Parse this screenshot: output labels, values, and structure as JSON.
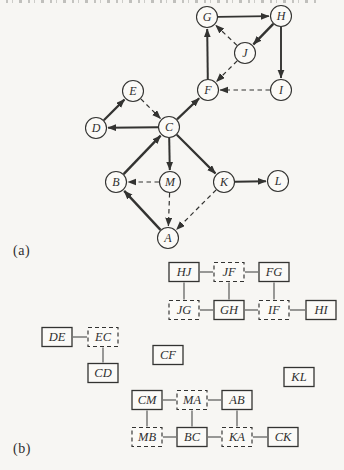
{
  "page": {
    "background": "#f7f6f3",
    "ink": "#333331",
    "node_fill": "#fbfaf7",
    "link_color": "#4a4a48"
  },
  "panel_a": {
    "label": "(a)",
    "node_radius": 10.5,
    "nodes": [
      {
        "id": "G",
        "x": 207,
        "y": 17
      },
      {
        "id": "H",
        "x": 281,
        "y": 16
      },
      {
        "id": "J",
        "x": 245,
        "y": 53
      },
      {
        "id": "F",
        "x": 208,
        "y": 90
      },
      {
        "id": "I",
        "x": 281,
        "y": 90
      },
      {
        "id": "E",
        "x": 133,
        "y": 91
      },
      {
        "id": "D",
        "x": 96,
        "y": 128
      },
      {
        "id": "C",
        "x": 169,
        "y": 127
      },
      {
        "id": "B",
        "x": 116,
        "y": 182
      },
      {
        "id": "M",
        "x": 170,
        "y": 182
      },
      {
        "id": "K",
        "x": 224,
        "y": 182
      },
      {
        "id": "L",
        "x": 278,
        "y": 181
      },
      {
        "id": "A",
        "x": 168,
        "y": 238
      }
    ],
    "edges": [
      {
        "from": "G",
        "to": "H",
        "style": "solid",
        "w": 1.7
      },
      {
        "from": "H",
        "to": "J",
        "style": "solid",
        "w": 2.4
      },
      {
        "from": "F",
        "to": "G",
        "style": "solid",
        "w": 2.0
      },
      {
        "from": "H",
        "to": "I",
        "style": "solid",
        "w": 1.9
      },
      {
        "from": "J",
        "to": "G",
        "style": "dashed",
        "w": 1.2
      },
      {
        "from": "J",
        "to": "F",
        "style": "dashed",
        "w": 1.2
      },
      {
        "from": "I",
        "to": "F",
        "style": "dashed",
        "w": 1.2
      },
      {
        "from": "C",
        "to": "F",
        "style": "solid",
        "w": 2.2
      },
      {
        "from": "D",
        "to": "E",
        "style": "solid",
        "w": 2.2
      },
      {
        "from": "E",
        "to": "C",
        "style": "dashed",
        "w": 1.2
      },
      {
        "from": "C",
        "to": "D",
        "style": "solid",
        "w": 2.0
      },
      {
        "from": "B",
        "to": "C",
        "style": "solid",
        "w": 2.4
      },
      {
        "from": "C",
        "to": "M",
        "style": "solid",
        "w": 2.0
      },
      {
        "from": "C",
        "to": "K",
        "style": "solid",
        "w": 2.2
      },
      {
        "from": "M",
        "to": "B",
        "style": "dashed",
        "w": 1.2
      },
      {
        "from": "M",
        "to": "A",
        "style": "dashed",
        "w": 1.2
      },
      {
        "from": "K",
        "to": "A",
        "style": "dashed",
        "w": 1.2
      },
      {
        "from": "K",
        "to": "L",
        "style": "solid",
        "w": 2.0
      },
      {
        "from": "A",
        "to": "B",
        "style": "solid",
        "w": 2.4
      }
    ]
  },
  "panel_b": {
    "label": "(b)",
    "box_w": 30,
    "box_h": 19,
    "boxes": [
      {
        "id": "HJ",
        "x": 184,
        "y": 272,
        "style": "solid"
      },
      {
        "id": "JF",
        "x": 229,
        "y": 272,
        "style": "dashed"
      },
      {
        "id": "FG",
        "x": 274,
        "y": 272,
        "style": "solid"
      },
      {
        "id": "JG",
        "x": 184,
        "y": 310,
        "style": "dashed"
      },
      {
        "id": "GH",
        "x": 229,
        "y": 310,
        "style": "solid"
      },
      {
        "id": "IF",
        "x": 274,
        "y": 310,
        "style": "dashed"
      },
      {
        "id": "HI",
        "x": 321,
        "y": 310,
        "style": "solid"
      },
      {
        "id": "DE",
        "x": 57,
        "y": 337,
        "style": "solid"
      },
      {
        "id": "EC",
        "x": 103,
        "y": 337,
        "style": "dashed"
      },
      {
        "id": "CD",
        "x": 103,
        "y": 373,
        "style": "solid"
      },
      {
        "id": "CF",
        "x": 168,
        "y": 355,
        "style": "solid"
      },
      {
        "id": "KL",
        "x": 299,
        "y": 377,
        "style": "solid"
      },
      {
        "id": "CM",
        "x": 147,
        "y": 400,
        "style": "solid"
      },
      {
        "id": "MA",
        "x": 192,
        "y": 400,
        "style": "dashed"
      },
      {
        "id": "AB",
        "x": 237,
        "y": 400,
        "style": "solid"
      },
      {
        "id": "MB",
        "x": 147,
        "y": 437,
        "style": "dashed"
      },
      {
        "id": "BC",
        "x": 192,
        "y": 437,
        "style": "solid"
      },
      {
        "id": "KA",
        "x": 237,
        "y": 437,
        "style": "dashed"
      },
      {
        "id": "CK",
        "x": 283,
        "y": 437,
        "style": "solid"
      }
    ],
    "links": [
      {
        "a": "HJ",
        "b": "JF"
      },
      {
        "a": "JF",
        "b": "FG"
      },
      {
        "a": "HJ",
        "b": "JG"
      },
      {
        "a": "JF",
        "b": "GH"
      },
      {
        "a": "FG",
        "b": "IF"
      },
      {
        "a": "JG",
        "b": "GH"
      },
      {
        "a": "GH",
        "b": "IF"
      },
      {
        "a": "IF",
        "b": "HI"
      },
      {
        "a": "DE",
        "b": "EC"
      },
      {
        "a": "EC",
        "b": "CD"
      },
      {
        "a": "CM",
        "b": "MA"
      },
      {
        "a": "MA",
        "b": "AB"
      },
      {
        "a": "CM",
        "b": "MB"
      },
      {
        "a": "MA",
        "b": "BC"
      },
      {
        "a": "AB",
        "b": "KA"
      },
      {
        "a": "MB",
        "b": "BC"
      },
      {
        "a": "BC",
        "b": "KA"
      },
      {
        "a": "KA",
        "b": "CK"
      }
    ]
  }
}
